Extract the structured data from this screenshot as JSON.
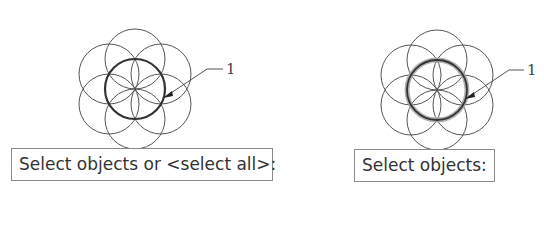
{
  "panels": [
    {
      "id": "left",
      "prompt": "Select objects or <select all>:",
      "callout": "1",
      "highlight": "thick"
    },
    {
      "id": "right",
      "prompt": "Select objects:",
      "callout": "1",
      "highlight": "selected-glow"
    }
  ],
  "colors": {
    "stroke": "#555555",
    "highlight": "#333333",
    "glow": "#9a9a9a",
    "box_border": "#8a8a8a"
  }
}
